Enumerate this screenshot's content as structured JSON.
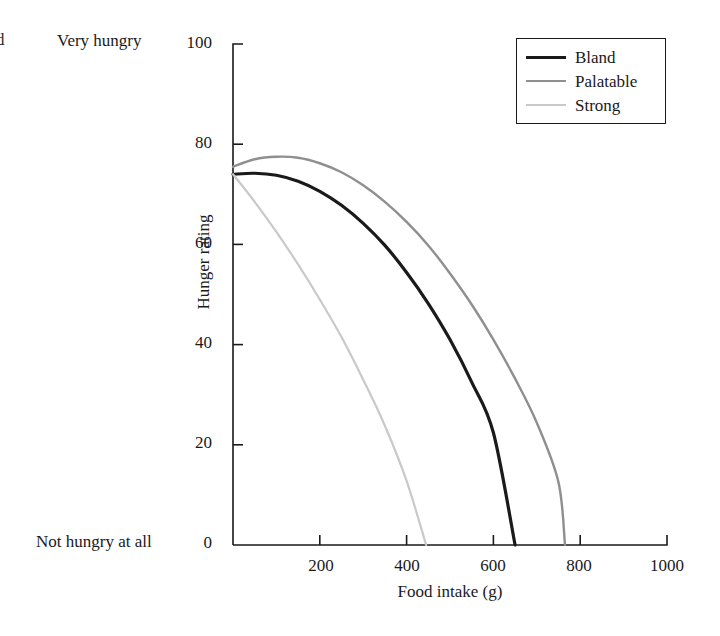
{
  "page": {
    "cut_off_text": "d",
    "background": "#ffffff"
  },
  "axes": {
    "y_top_annotation": "Very hungry",
    "y_bottom_annotation": "Not hungry at all",
    "y_label": "Hunger rating",
    "x_label": "Food intake (g)",
    "y_ticks": [
      "0",
      "20",
      "40",
      "60",
      "80",
      "100"
    ],
    "x_ticks": [
      "0",
      "200",
      "400",
      "600",
      "800",
      "1000"
    ]
  },
  "legend": {
    "position": "top-right",
    "entries": [
      {
        "label": "Bland",
        "color": "#1a1a1a",
        "width": 3.2
      },
      {
        "label": "Palatable",
        "color": "#8f8f8f",
        "width": 2.4
      },
      {
        "label": "Strong",
        "color": "#c9c9c9",
        "width": 2.2
      }
    ]
  },
  "chart_data": {
    "type": "line",
    "title": "",
    "subtitle": "",
    "xlabel": "Food intake (g)",
    "ylabel": "Hunger rating",
    "xlim": [
      0,
      1000
    ],
    "ylim": [
      0,
      100
    ],
    "grid": false,
    "legend_position": "top-right",
    "xticks": [
      0,
      200,
      400,
      600,
      800,
      1000
    ],
    "yticks": [
      0,
      20,
      40,
      60,
      80,
      100
    ],
    "annotations": [
      {
        "text": "Very hungry",
        "at": "y=100 outside left"
      },
      {
        "text": "Not hungry at all",
        "at": "y=0 outside left"
      }
    ],
    "series": [
      {
        "name": "Bland",
        "color": "#1a1a1a",
        "x": [
          0,
          50,
          100,
          150,
          200,
          250,
          300,
          350,
          400,
          450,
          500,
          550,
          600,
          650
        ],
        "y": [
          74.0,
          74.2,
          73.8,
          72.6,
          70.6,
          67.8,
          64.2,
          59.8,
          54.4,
          48.2,
          41.0,
          32.5,
          22.4,
          0.0
        ]
      },
      {
        "name": "Palatable",
        "color": "#8f8f8f",
        "x": [
          0,
          50,
          100,
          150,
          200,
          250,
          300,
          350,
          400,
          450,
          500,
          550,
          600,
          650,
          700,
          750,
          765
        ],
        "y": [
          75.5,
          77.0,
          77.5,
          77.3,
          76.2,
          74.4,
          71.8,
          68.5,
          64.5,
          59.8,
          54.2,
          48.0,
          41.0,
          33.2,
          24.4,
          12.5,
          0.0
        ]
      },
      {
        "name": "Strong",
        "color": "#c9c9c9",
        "x": [
          0,
          50,
          100,
          150,
          200,
          250,
          300,
          350,
          400,
          445
        ],
        "y": [
          74.0,
          68.5,
          62.5,
          56.0,
          49.0,
          41.5,
          33.0,
          23.8,
          12.8,
          0.0
        ]
      }
    ]
  },
  "geometry": {
    "plot_left_px": 233,
    "plot_right_px": 667,
    "plot_top_px": 44,
    "plot_bottom_px": 545
  }
}
